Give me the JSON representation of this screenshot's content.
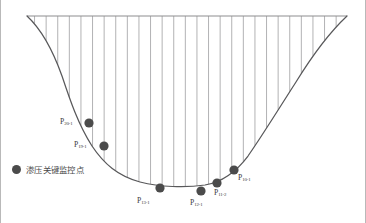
{
  "figure": {
    "title": "",
    "type": "engineering-cross-section",
    "colors": {
      "profile_line": "#58585a",
      "hatch_line": "#a9a9ab",
      "top_line": "#8d8d8f",
      "point_fill": "#4b4b4b",
      "frame": "#b9b9b9",
      "background": "#ffffff",
      "label_text": "#3a3a3a"
    },
    "geometry": {
      "top_line_y": 16,
      "top_line_x_start": 27,
      "top_line_x_end": 347,
      "hatch_spacing": 11.6,
      "profile_path": "M 27 16 C 40 28, 52 48, 62 76 C 70 100, 78 124, 92 146 C 104 164, 118 176, 140 182 C 160 187, 185 188, 205 185 C 222 182, 236 172, 248 156 C 262 136, 278 110, 296 82 C 312 56, 330 32, 347 16"
    }
  },
  "legend": {
    "swatch_icon": "filled-circle-icon",
    "label": "渗压关键监控点"
  },
  "chart_data": {
    "type": "scatter",
    "title": "",
    "xlabel": "",
    "ylabel": "",
    "grid": false,
    "legend_position": "left-middle",
    "series": [
      {
        "name": "渗压关键监控点",
        "marker": "filled-circle",
        "color": "#4b4b4b",
        "points": [
          {
            "id": "P20-1",
            "base": "P",
            "sub": "20-1",
            "x": 89,
            "y": 123,
            "label_x": 60,
            "label_y": 118,
            "label_align": "left"
          },
          {
            "id": "P19-1",
            "base": "P",
            "sub": "19-1",
            "x": 104,
            "y": 146,
            "label_x": 74,
            "label_y": 141,
            "label_align": "left"
          },
          {
            "id": "P13-1",
            "base": "P",
            "sub": "13-1",
            "x": 160,
            "y": 188,
            "label_x": 137,
            "label_y": 197,
            "label_align": "left"
          },
          {
            "id": "P12-1",
            "base": "P",
            "sub": "12-1",
            "x": 201,
            "y": 191,
            "label_x": 190,
            "label_y": 199,
            "label_align": "left"
          },
          {
            "id": "P11-2",
            "base": "P",
            "sub": "11-2",
            "x": 217,
            "y": 183,
            "label_x": 214,
            "label_y": 189,
            "label_align": "left"
          },
          {
            "id": "P10-1",
            "base": "P",
            "sub": "10-1",
            "x": 234,
            "y": 170,
            "label_x": 238,
            "label_y": 174,
            "label_align": "left"
          }
        ]
      }
    ]
  }
}
